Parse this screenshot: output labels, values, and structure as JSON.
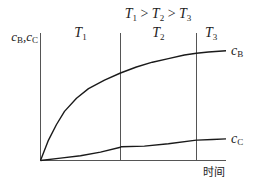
{
  "chart_data": {
    "type": "line",
    "title": "T1 > T2 > T3",
    "title_parts": {
      "t1": "T",
      "s1": "1",
      "gt1": " > ",
      "t2": "T",
      "s2": "2",
      "gt2": " > ",
      "t3": "T",
      "s3": "3"
    },
    "xlabel": "时间",
    "ylabel": "cB, cC",
    "ylabel_parts": {
      "c1": "c",
      "s1": "B",
      "sep": ",",
      "c2": "c",
      "s2": "C"
    },
    "regions": [
      {
        "name": "T",
        "sub": "1",
        "x_range": [
          0,
          1.0
        ]
      },
      {
        "name": "T",
        "sub": "2",
        "x_range": [
          1.0,
          1.95
        ]
      },
      {
        "name": "T",
        "sub": "3",
        "x_range": [
          1.95,
          2.32
        ]
      }
    ],
    "dividers_x": [
      1.0,
      1.95
    ],
    "xlim": [
      0,
      2.32
    ],
    "ylim": [
      0,
      1.0
    ],
    "ticks": "none",
    "grid": false,
    "series": [
      {
        "name": "cB",
        "label_c": "c",
        "label_sub": "B",
        "x": [
          0,
          0.1,
          0.2,
          0.3,
          0.45,
          0.6,
          0.8,
          1.0,
          1.2,
          1.4,
          1.6,
          1.8,
          1.95,
          2.1,
          2.32
        ],
        "y": [
          0,
          0.17,
          0.3,
          0.41,
          0.52,
          0.6,
          0.67,
          0.73,
          0.78,
          0.82,
          0.85,
          0.88,
          0.895,
          0.905,
          0.915
        ]
      },
      {
        "name": "cC",
        "label_c": "c",
        "label_sub": "C",
        "x": [
          0,
          0.25,
          0.5,
          0.75,
          1.0,
          1.01,
          1.3,
          1.6,
          1.95,
          1.96,
          2.15,
          2.32
        ],
        "y": [
          0,
          0.02,
          0.04,
          0.07,
          0.11,
          0.115,
          0.12,
          0.14,
          0.17,
          0.17,
          0.175,
          0.18
        ]
      }
    ]
  }
}
